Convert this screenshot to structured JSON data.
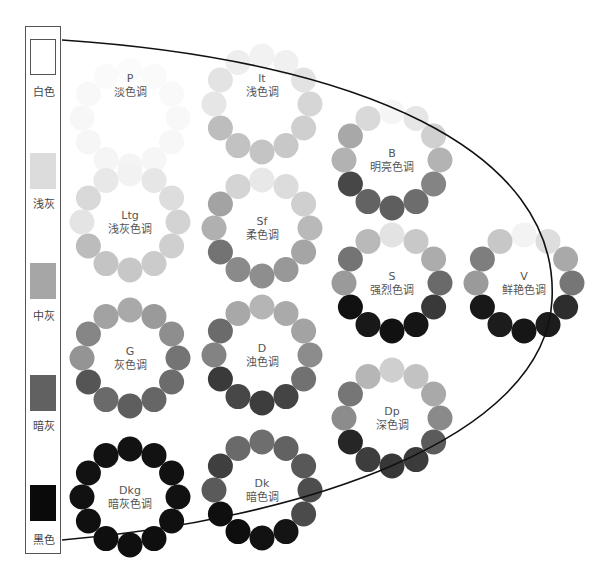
{
  "legend_bar": {
    "items": [
      {
        "label": "白色",
        "color": "#ffffff",
        "border": "#555555",
        "top": 12,
        "label_top": 56
      },
      {
        "label": "浅灰",
        "color": "#dcdcdc",
        "border": "none",
        "top": 126,
        "label_top": 168
      },
      {
        "label": "中灰",
        "color": "#a6a6a6",
        "border": "none",
        "top": 236,
        "label_top": 280
      },
      {
        "label": "暗灰",
        "color": "#616161",
        "border": "none",
        "top": 348,
        "label_top": 390
      },
      {
        "label": "黑色",
        "color": "#0a0a0a",
        "border": "none",
        "top": 458,
        "label_top": 504
      }
    ]
  },
  "tone_rings": [
    {
      "code": "P",
      "name": "淡色调",
      "cx": 130,
      "cy": 118,
      "label_y": 72,
      "colors": [
        "#fbfbfb",
        "#fafafa",
        "#f9f9f9",
        "#f8f8f8",
        "#f7f7f7",
        "#f6f6f6",
        "#f4f4f4",
        "#f5f5f5",
        "#f6f6f6",
        "#f7f7f7",
        "#f8f8f8",
        "#fafafa"
      ]
    },
    {
      "code": "lt",
      "name": "浅色调",
      "cx": 262,
      "cy": 104,
      "label_y": 72,
      "colors": [
        "#f2f2f2",
        "#f0f0f0",
        "#e3e3e3",
        "#d6d6d6",
        "#cfcfcf",
        "#c8c8c8",
        "#c4c4c4",
        "#c2c2c2",
        "#bdbdbd",
        "#e6e6e6",
        "#e3e3e3",
        "#eeeeee"
      ]
    },
    {
      "code": "Ltg",
      "name": "浅灰色调",
      "cx": 130,
      "cy": 222,
      "label_y": 209,
      "colors": [
        "#f2f2f2",
        "#e6e6e6",
        "#dddddd",
        "#d3d3d3",
        "#cfcfcf",
        "#cbcbcb",
        "#c7c7c7",
        "#c4c4c4",
        "#bcbcbc",
        "#e4e4e4",
        "#d9d9d9",
        "#e8e8e8"
      ]
    },
    {
      "code": "Sf",
      "name": "柔色调",
      "cx": 262,
      "cy": 228,
      "label_y": 215,
      "colors": [
        "#e8e8e8",
        "#dcdcdc",
        "#cfcfcf",
        "#b9b9b9",
        "#a5a5a5",
        "#989898",
        "#8e8e8e",
        "#8a8a8a",
        "#737373",
        "#b0b0b0",
        "#a3a3a3",
        "#d4d4d4"
      ]
    },
    {
      "code": "G",
      "name": "灰色调",
      "cx": 130,
      "cy": 358,
      "label_y": 345,
      "colors": [
        "#a9a9a9",
        "#9a9a9a",
        "#8e8e8e",
        "#747474",
        "#6c6c6c",
        "#666666",
        "#5e5e5e",
        "#6a6a6a",
        "#555555",
        "#949494",
        "#868686",
        "#a2a2a2"
      ]
    },
    {
      "code": "D",
      "name": "浊色调",
      "cx": 262,
      "cy": 355,
      "label_y": 342,
      "colors": [
        "#b5b5b5",
        "#aaaaaa",
        "#a3a3a3",
        "#8c8c8c",
        "#717171",
        "#444444",
        "#3d3d3d",
        "#474747",
        "#3a3a3a",
        "#838383",
        "#6b6b6b",
        "#a8a8a8"
      ]
    },
    {
      "code": "B",
      "name": "明亮色调",
      "cx": 392,
      "cy": 160,
      "label_y": 147,
      "colors": [
        "#f5f5f5",
        "#e6e6e6",
        "#d0d0d0",
        "#b3b3b3",
        "#848484",
        "#6d6d6d",
        "#5e5e5e",
        "#636363",
        "#474747",
        "#b2b2b2",
        "#a8a8a8",
        "#d9d9d9"
      ]
    },
    {
      "code": "S",
      "name": "强烈色调",
      "cx": 392,
      "cy": 283,
      "label_y": 270,
      "colors": [
        "#e3e3e3",
        "#c8c8c8",
        "#acacac",
        "#6a6a6a",
        "#393939",
        "#151515",
        "#111111",
        "#181818",
        "#111111",
        "#9a9a9a",
        "#747474",
        "#b9b9b9"
      ]
    },
    {
      "code": "Dp",
      "name": "深色调",
      "cx": 392,
      "cy": 418,
      "label_y": 405,
      "colors": [
        "#cfcfcf",
        "#c2c2c2",
        "#a9a9a9",
        "#8a8a8a",
        "#5b5b5b",
        "#3b3b3b",
        "#373737",
        "#3d3d3d",
        "#262626",
        "#8c8c8c",
        "#767676",
        "#b6b6b6"
      ]
    },
    {
      "code": "V",
      "name": "鲜艳色调",
      "cx": 524,
      "cy": 283,
      "label_y": 270,
      "colors": [
        "#f3f3f3",
        "#dedede",
        "#a9a9a9",
        "#767676",
        "#2d2d2d",
        "#1c1c1c",
        "#161616",
        "#1c1c1c",
        "#181818",
        "#9a9a9a",
        "#7e7e7e",
        "#c7c7c7"
      ]
    },
    {
      "code": "Dkg",
      "name": "暗灰色调",
      "cx": 130,
      "cy": 497,
      "label_y": 484,
      "colors": [
        "#121212",
        "#121212",
        "#111111",
        "#111111",
        "#101010",
        "#0f0f0f",
        "#0f0f0f",
        "#0f0f0f",
        "#101010",
        "#111111",
        "#121212",
        "#121212"
      ]
    },
    {
      "code": "Dk",
      "name": "暗色调",
      "cx": 262,
      "cy": 490,
      "label_y": 477,
      "colors": [
        "#6e6e6e",
        "#626262",
        "#585858",
        "#4d4d4d",
        "#4b4b4b",
        "#141414",
        "#121212",
        "#0e0e0e",
        "#0f0f0f",
        "#5a5a5a",
        "#3f3f3f",
        "#6a6a6a"
      ]
    }
  ],
  "ring_geometry": {
    "ring_radius": 48,
    "dot_radius": 12.5,
    "dot_count": 12
  },
  "boundary_curve": {
    "color": "#111111",
    "path": "M 62 40 C 360 60, 560 150, 552 300 C 545 440, 300 520, 62 540"
  }
}
